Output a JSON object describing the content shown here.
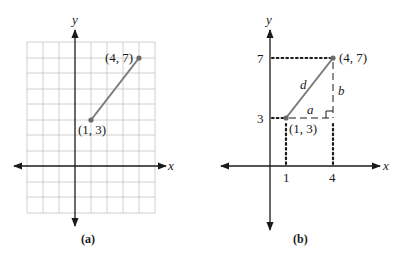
{
  "figure_a": {
    "caption": "(a)",
    "x_axis_label": "x",
    "y_axis_label": "y",
    "grid": {
      "x_range": [
        -3,
        5
      ],
      "y_range": [
        -3,
        8
      ],
      "visible": true
    },
    "points": [
      {
        "label": "(1, 3)",
        "x": 1,
        "y": 3
      },
      {
        "label": "(4, 7)",
        "x": 4,
        "y": 7
      }
    ],
    "segment_color": "#7a7a7a"
  },
  "figure_b": {
    "caption": "(b)",
    "x_axis_label": "x",
    "y_axis_label": "y",
    "x_ticks": [
      "1",
      "4"
    ],
    "y_ticks": [
      "3",
      "7"
    ],
    "points": [
      {
        "label": "(1, 3)",
        "x": 1,
        "y": 3
      },
      {
        "label": "(4, 7)",
        "x": 4,
        "y": 7
      }
    ],
    "labels": {
      "hypotenuse": "d",
      "horizontal_leg": "a",
      "vertical_leg": "b"
    },
    "segment_color": "#7a7a7a"
  }
}
